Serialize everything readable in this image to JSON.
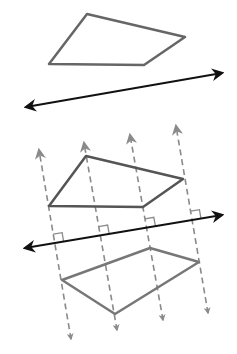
{
  "diagram": {
    "colors": {
      "shape": "#666666",
      "line": "#111111",
      "dashed": "#8a8a8a",
      "mark": "#8a8a8a"
    },
    "top_shape": [
      [
        87,
        14
      ],
      [
        185,
        37
      ],
      [
        144,
        65
      ],
      [
        49,
        64
      ]
    ],
    "top_line": [
      [
        26,
        107
      ],
      [
        222,
        73
      ]
    ],
    "middle_shape": [
      [
        49,
        206
      ],
      [
        86,
        156
      ],
      [
        183,
        179
      ],
      [
        143,
        207
      ]
    ],
    "middle_line": [
      [
        25,
        248
      ],
      [
        222,
        215
      ]
    ],
    "bottom_shape": [
      [
        62,
        280
      ],
      [
        150,
        248
      ],
      [
        199,
        262
      ],
      [
        115,
        314
      ]
    ],
    "perpendiculars": [
      [
        [
          39,
          150
        ],
        [
          71,
          339
        ]
      ],
      [
        [
          84,
          143
        ],
        [
          117,
          330
        ]
      ],
      [
        [
          130,
          135
        ],
        [
          163,
          320
        ]
      ],
      [
        [
          176,
          126
        ],
        [
          208,
          313
        ]
      ]
    ]
  }
}
